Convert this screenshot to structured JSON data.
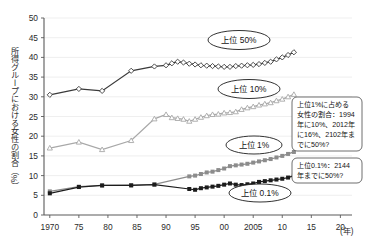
{
  "chart_data": {
    "type": "line",
    "title": "",
    "xlabel": "(年)",
    "ylabel": "所得グループにおける女性の割合（%）",
    "xlim": [
      1969,
      2022
    ],
    "ylim": [
      0,
      50
    ],
    "yticks": [
      0,
      5,
      10,
      15,
      20,
      25,
      30,
      35,
      40,
      45,
      50
    ],
    "xticks": [
      1970,
      1975,
      1980,
      1985,
      1990,
      1995,
      2000,
      2005,
      2010,
      2015,
      2020
    ],
    "xticklabels": [
      "1970",
      "75",
      "80",
      "85",
      "90",
      "95",
      "00",
      "2005",
      "10",
      "15",
      "20"
    ],
    "grid": true,
    "legend_position": "inline-labels",
    "series": [
      {
        "name": "上位 50%",
        "color": "#3a3a3a",
        "marker": "open-diamond",
        "x": [
          1970,
          1975,
          1979,
          1984,
          1988,
          1990,
          1991,
          1992,
          1993,
          1994,
          1995,
          1996,
          1997,
          1998,
          1999,
          2000,
          2001,
          2002,
          2003,
          2004,
          2005,
          2006,
          2007,
          2008,
          2009,
          2010,
          2011,
          2012
        ],
        "values": [
          30.5,
          32.0,
          31.5,
          36.6,
          37.7,
          38.0,
          38.5,
          38.9,
          38.7,
          38.4,
          38.2,
          38.0,
          37.9,
          37.8,
          37.7,
          37.6,
          37.6,
          37.8,
          37.9,
          38.0,
          38.1,
          38.3,
          38.6,
          38.9,
          39.5,
          40.0,
          40.6,
          41.3
        ]
      },
      {
        "name": "上位 10%",
        "color": "#a8a8a8",
        "marker": "open-triangle",
        "x": [
          1970,
          1975,
          1979,
          1984,
          1988,
          1990,
          1991,
          1992,
          1993,
          1994,
          1995,
          1996,
          1997,
          1998,
          1999,
          2000,
          2001,
          2002,
          2003,
          2004,
          2005,
          2006,
          2007,
          2008,
          2009,
          2010,
          2011,
          2012
        ],
        "values": [
          17.0,
          18.5,
          16.6,
          18.9,
          24.4,
          25.5,
          24.7,
          24.5,
          24.3,
          23.8,
          24.3,
          24.8,
          25.2,
          25.5,
          25.6,
          25.9,
          26.0,
          26.2,
          26.8,
          27.2,
          27.5,
          27.9,
          28.2,
          28.5,
          29.0,
          29.4,
          30.0,
          30.6
        ]
      },
      {
        "name": "上位 1%",
        "color": "#8c8c8c",
        "marker": "filled-square",
        "x": [
          1970,
          1975,
          1979,
          1984,
          1988,
          1994,
          1995,
          1996,
          1997,
          1998,
          1999,
          2000,
          2001,
          2002,
          2003,
          2004,
          2005,
          2006,
          2007,
          2008,
          2009,
          2010,
          2011,
          2012
        ],
        "values": [
          6.0,
          7.2,
          7.5,
          7.6,
          7.8,
          9.8,
          10.0,
          10.4,
          10.8,
          11.0,
          11.4,
          11.8,
          12.4,
          12.6,
          12.8,
          13.0,
          13.3,
          13.6,
          13.9,
          14.2,
          14.6,
          15.0,
          15.5,
          16.0
        ]
      },
      {
        "name": "上位 0.1%",
        "color": "#1c1c1c",
        "marker": "filled-square",
        "x": [
          1970,
          1975,
          1979,
          1984,
          1988,
          1994,
          1995,
          1996,
          1997,
          1998,
          1999,
          2000,
          2001,
          2002,
          2003,
          2004,
          2005,
          2006,
          2007,
          2008,
          2009,
          2010,
          2011,
          2012
        ],
        "values": [
          5.5,
          7.1,
          7.5,
          7.5,
          7.7,
          6.6,
          6.4,
          6.8,
          7.0,
          7.2,
          7.4,
          7.7,
          8.0,
          7.7,
          7.6,
          7.8,
          8.0,
          8.4,
          8.6,
          8.8,
          9.0,
          9.2,
          9.5,
          10.0
        ]
      }
    ],
    "annotations": [
      {
        "id": "callout-top1",
        "lines": [
          "上位1%に占める",
          "女性の割合：1994",
          "年に10%、2012年",
          "に16%、2102年ま",
          "でに50%?"
        ]
      },
      {
        "id": "callout-top01",
        "lines": [
          "上位0.1%：2144",
          "年までに50%?"
        ]
      }
    ]
  }
}
